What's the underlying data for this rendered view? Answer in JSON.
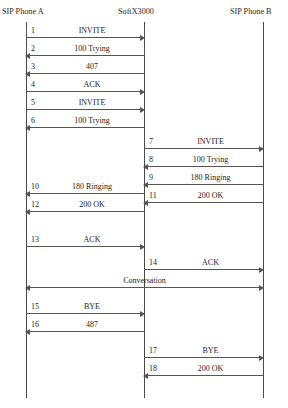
{
  "diagram": {
    "title_visible": false,
    "type": "sip-call-flow-sequence-diagram",
    "columns": [
      {
        "id": "a",
        "label": "SIP Phone A"
      },
      {
        "id": "s",
        "label": "SoftX3000"
      },
      {
        "id": "b",
        "label": "SIP Phone B"
      }
    ],
    "messages": [
      {
        "num": "1",
        "label": "INVITE",
        "from": "a",
        "to": "s",
        "direction": "right"
      },
      {
        "num": "2",
        "label": "100 Trying",
        "from": "s",
        "to": "a",
        "direction": "left"
      },
      {
        "num": "3",
        "label": "407",
        "from": "s",
        "to": "a",
        "direction": "left"
      },
      {
        "num": "4",
        "label": "ACK",
        "from": "a",
        "to": "s",
        "direction": "right"
      },
      {
        "num": "5",
        "label": "INVITE",
        "from": "a",
        "to": "s",
        "direction": "right"
      },
      {
        "num": "6",
        "label": "100 Trying",
        "from": "s",
        "to": "a",
        "direction": "left"
      },
      {
        "num": "7",
        "label": "INVITE",
        "from": "s",
        "to": "b",
        "direction": "right"
      },
      {
        "num": "8",
        "label": "100 Trying",
        "from": "b",
        "to": "s",
        "direction": "left"
      },
      {
        "num": "9",
        "label": "180 Ringing",
        "from": "b",
        "to": "s",
        "direction": "left"
      },
      {
        "num": "10",
        "label": "180 Ringing",
        "from": "s",
        "to": "a",
        "direction": "left"
      },
      {
        "num": "11",
        "label": "200 OK",
        "from": "b",
        "to": "s",
        "direction": "left"
      },
      {
        "num": "12",
        "label": "200 OK",
        "from": "s",
        "to": "a",
        "direction": "left"
      },
      {
        "num": "13",
        "label": "ACK",
        "from": "a",
        "to": "s",
        "direction": "right"
      },
      {
        "num": "14",
        "label": "ACK",
        "from": "s",
        "to": "b",
        "direction": "right"
      },
      {
        "num": "",
        "label": "Conversation",
        "from": "a",
        "to": "b",
        "direction": "both"
      },
      {
        "num": "15",
        "label": "BYE",
        "from": "a",
        "to": "s",
        "direction": "right"
      },
      {
        "num": "16",
        "label": "487",
        "from": "s",
        "to": "a",
        "direction": "left"
      },
      {
        "num": "17",
        "label": "BYE",
        "from": "s",
        "to": "b",
        "direction": "right"
      },
      {
        "num": "18",
        "label": "200 OK",
        "from": "b",
        "to": "s",
        "direction": "left"
      }
    ]
  }
}
